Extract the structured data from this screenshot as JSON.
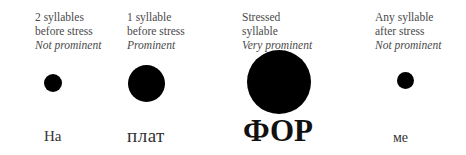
{
  "diagram": {
    "title": "",
    "columns": [
      {
        "caption_lines": [
          "2 syllables",
          "before stress"
        ],
        "prominence": "Not prominent",
        "syllable": "На",
        "dot_diameter": 18
      },
      {
        "caption_lines": [
          "1 syllable",
          "before stress"
        ],
        "prominence": "Prominent",
        "syllable": "плат",
        "dot_diameter": 37
      },
      {
        "caption_lines": [
          "Stressed",
          "syllable"
        ],
        "prominence": "Very prominent",
        "syllable": "ФОР",
        "dot_diameter": 64
      },
      {
        "caption_lines": [
          "Any syllable",
          "after stress"
        ],
        "prominence": "Not prominent",
        "syllable": "ме",
        "dot_diameter": 17
      }
    ],
    "colors": {
      "dot": "#000000",
      "text": "#4a4a4a",
      "background": "#ffffff"
    }
  }
}
